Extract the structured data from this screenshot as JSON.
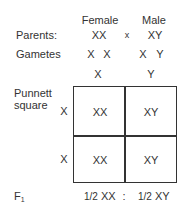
{
  "header": {
    "female": "Female",
    "male": "Male"
  },
  "parents": {
    "label": "Parents:",
    "female": "XX",
    "cross": "x",
    "male": "XY"
  },
  "gametes": {
    "label": "Gametes",
    "female": [
      "X",
      "X"
    ],
    "male": [
      "X",
      "Y"
    ]
  },
  "punnett": {
    "label_line1": "Punnett",
    "label_line2": "square",
    "column_headers": [
      "X",
      "Y"
    ],
    "row_headers": [
      "X",
      "X"
    ],
    "cells": [
      [
        "XX",
        "XY"
      ],
      [
        "XX",
        "XY"
      ]
    ]
  },
  "f1": {
    "label": "F",
    "label_sub": "1",
    "ratio": [
      {
        "fraction": "1/2",
        "genotype": "XX"
      },
      {
        "fraction": "1/2",
        "genotype": "XY"
      }
    ],
    "separator": ":"
  }
}
